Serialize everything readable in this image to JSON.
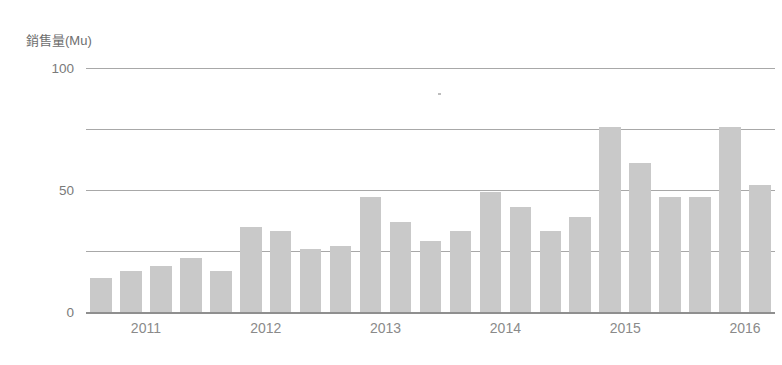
{
  "chart_data": {
    "type": "bar",
    "title": "",
    "ylabel": "銷售量(Mu)",
    "xlabel": "",
    "ylim": [
      0,
      100
    ],
    "grid": true,
    "legend": null,
    "y_ticks": [
      {
        "value": 100,
        "label": "100",
        "labeled": true
      },
      {
        "value": 75,
        "label": "",
        "labeled": false
      },
      {
        "value": 50,
        "label": "50",
        "labeled": true
      },
      {
        "value": 25,
        "label": "",
        "labeled": false
      },
      {
        "value": 0,
        "label": "0",
        "labeled": true
      }
    ],
    "x_tick_labels": [
      "2011",
      "2012",
      "2013",
      "2014",
      "2015",
      "2016"
    ],
    "categories": [
      "2011 Q1",
      "2011 Q2",
      "2011 Q3",
      "2011 Q4",
      "2012 Q1",
      "2012 Q2",
      "2012 Q3",
      "2012 Q4",
      "2013 Q1",
      "2013 Q2",
      "2013 Q3",
      "2013 Q4",
      "2014 Q1",
      "2014 Q2",
      "2014 Q3",
      "2014 Q4",
      "2015 Q1",
      "2015 Q2",
      "2015 Q3",
      "2015 Q4",
      "2016 Q1",
      "2016 Q2",
      "2016 Q3"
    ],
    "values": [
      14,
      17,
      19,
      22,
      17,
      35,
      33,
      26,
      27,
      47,
      37,
      29,
      33,
      49,
      43,
      33,
      39,
      76,
      61,
      47,
      47,
      76,
      52
    ],
    "bar_color": "#c9c9c9",
    "gridline_color": "#a8a8a8",
    "axis_color": "#8f8f8f",
    "label_color": "#7a7a7a",
    "background_color": "#ffffff"
  }
}
